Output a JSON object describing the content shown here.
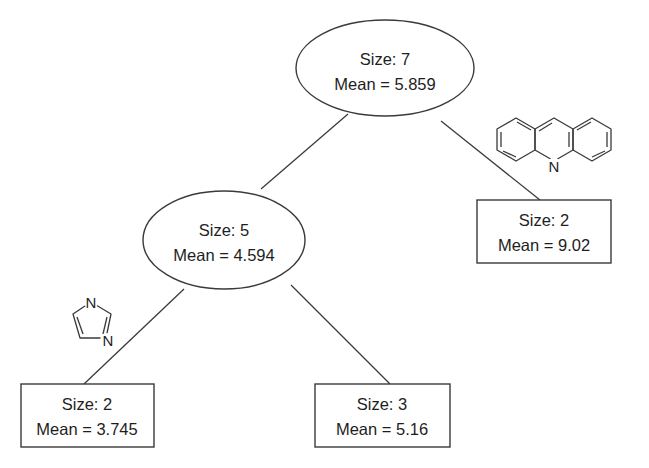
{
  "diagram": {
    "type": "regression-tree",
    "colors": {
      "line": "#3a3a3a",
      "text": "#1e1e1e",
      "background": "#ffffff"
    },
    "nodes": [
      {
        "id": "root",
        "shape": "ellipse",
        "size_label": "Size: 7",
        "mean_label": "Mean = 5.859",
        "size": 7,
        "mean": 5.859
      },
      {
        "id": "internal-left",
        "shape": "ellipse",
        "size_label": "Size: 5",
        "mean_label": "Mean = 4.594",
        "size": 5,
        "mean": 4.594
      },
      {
        "id": "leaf-right",
        "shape": "box",
        "size_label": "Size: 2",
        "mean_label": "Mean = 9.02",
        "size": 2,
        "mean": 9.02
      },
      {
        "id": "leaf-left-left",
        "shape": "box",
        "size_label": "Size: 2",
        "mean_label": "Mean = 3.745",
        "size": 2,
        "mean": 3.745
      },
      {
        "id": "leaf-left-right",
        "shape": "box",
        "size_label": "Size: 3",
        "mean_label": "Mean = 5.16",
        "size": 3,
        "mean": 5.16
      }
    ],
    "edges": [
      {
        "from": "root",
        "to": "internal-left"
      },
      {
        "from": "root",
        "to": "leaf-right",
        "split_structure": "acridine"
      },
      {
        "from": "internal-left",
        "to": "leaf-left-left",
        "split_structure": "imidazole"
      },
      {
        "from": "internal-left",
        "to": "leaf-left-right"
      }
    ],
    "structures": {
      "acridine": {
        "name": "acridine",
        "atom_label": "N"
      },
      "imidazole": {
        "name": "imidazole",
        "atom_labels": [
          "N",
          "N"
        ]
      }
    }
  }
}
